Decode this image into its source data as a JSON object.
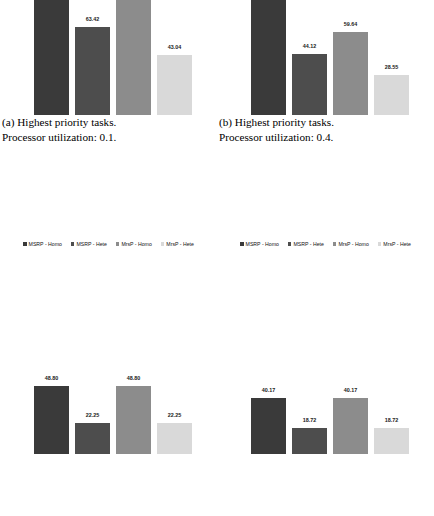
{
  "figure": {
    "legend_labels": [
      "MSRP - Homo",
      "MSRP - Hete",
      "MrsP - Homo",
      "MrsP - Hete"
    ],
    "series_colors": [
      "#3a3a3a",
      "#4d4d4d",
      "#8c8c8c",
      "#d9d9d9"
    ]
  },
  "panels": [
    {
      "id": "a",
      "caption_line1": "(a) Highest priority tasks.",
      "caption_line2": "Processor utilization: 0.1."
    },
    {
      "id": "b",
      "caption_line1": "(b) Highest priority tasks.",
      "caption_line2": "Processor utilization: 0.4."
    },
    {
      "id": "c",
      "caption_line1": "",
      "caption_line2": ""
    },
    {
      "id": "d",
      "caption_line1": "",
      "caption_line2": ""
    }
  ],
  "chart_data": [
    {
      "type": "bar",
      "id": "a",
      "title": "(a) Highest priority tasks. Processor utilization: 0.1.",
      "xlabel": "",
      "ylabel": "",
      "grid": false,
      "legend_position": "below",
      "categories": [
        "MSRP - Homo",
        "MSRP - Hete",
        "MrsP - Homo",
        "MrsP - Hete"
      ],
      "values": [
        100.0,
        63.42,
        93.5,
        43.04
      ],
      "value_labels": [
        "",
        "63.42",
        "",
        "43.04"
      ],
      "ylim": [
        0,
        110
      ]
    },
    {
      "type": "bar",
      "id": "b",
      "title": "(b) Highest priority tasks. Processor utilization: 0.4.",
      "xlabel": "",
      "ylabel": "",
      "grid": false,
      "legend_position": "below",
      "categories": [
        "MSRP - Homo",
        "MSRP - Hete",
        "MrsP - Homo",
        "MrsP - Hete"
      ],
      "values": [
        100.0,
        44.12,
        59.64,
        28.55
      ],
      "value_labels": [
        "",
        "44.12",
        "59.64",
        "28.55"
      ],
      "ylim": [
        0,
        110
      ]
    },
    {
      "type": "bar",
      "id": "c",
      "title": "",
      "xlabel": "",
      "ylabel": "",
      "grid": false,
      "legend_position": "none",
      "categories": [
        "MSRP - Homo",
        "MSRP - Hete",
        "MrsP - Homo",
        "MrsP - Hete"
      ],
      "values": [
        48.8,
        22.25,
        48.8,
        22.25
      ],
      "value_labels": [
        "48.80",
        "22.25",
        "48.80",
        "22.25"
      ],
      "ylim": [
        0,
        110
      ]
    },
    {
      "type": "bar",
      "id": "d",
      "title": "",
      "xlabel": "",
      "ylabel": "",
      "grid": false,
      "legend_position": "none",
      "categories": [
        "MSRP - Homo",
        "MSRP - Hete",
        "MrsP - Homo",
        "MrsP - Hete"
      ],
      "values": [
        40.17,
        18.72,
        40.17,
        18.72
      ],
      "value_labels": [
        "40.17",
        "18.72",
        "40.17",
        "18.72"
      ],
      "ylim": [
        0,
        110
      ]
    }
  ]
}
